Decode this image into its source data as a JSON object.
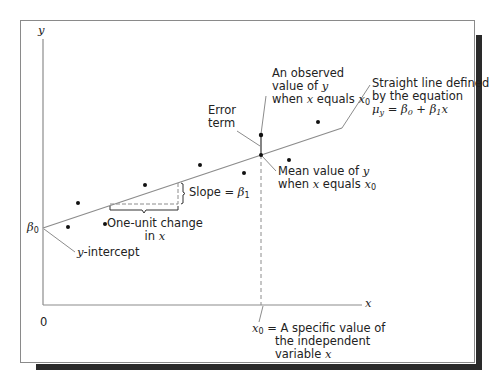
{
  "figure": {
    "axes": {
      "y_label": "y",
      "x_label": "x",
      "origin_label": "0",
      "beta0_label": "β",
      "beta0_sub": "0"
    },
    "annotations": {
      "observed": {
        "line1": "An observed",
        "line2_prefix": "value of ",
        "line2_var": "y",
        "line3_prefix": "when ",
        "line3_var": "x",
        "line3_mid": " equals ",
        "line3_sub_var": "x",
        "line3_sub": "0"
      },
      "straight_line": {
        "line1": "Straight line defined",
        "line2": "by the equation",
        "eq_mu": "μ",
        "eq_mu_sub": "y",
        "eq_rest_1": " = β",
        "eq_sub0": "0",
        "eq_rest_2": " + β",
        "eq_sub1": "1",
        "eq_x": "x"
      },
      "error_term": {
        "line1": "Error",
        "line2": "term"
      },
      "mean_value": {
        "line1_prefix": "Mean value of ",
        "line1_var": "y",
        "line2_prefix": "when ",
        "line2_var": "x",
        "line2_mid": " equals ",
        "line2_sub_var": "x",
        "line2_sub": "0"
      },
      "slope": {
        "prefix": "Slope = ",
        "beta": "β",
        "sub": "1"
      },
      "one_unit": {
        "line1": "One-unit change",
        "line2_prefix": "in ",
        "line2_var": "x"
      },
      "y_intercept": {
        "var": "y",
        "rest": "-intercept"
      },
      "x0_def": {
        "var": "x",
        "sub": "0",
        "line1_rest": " = A specific value of",
        "line2": "the independent",
        "line3_prefix": "variable ",
        "line3_var": "x"
      }
    },
    "colors": {
      "line": "#8c8c8c",
      "point": "#111111",
      "shadow": "#2a2a2a",
      "frame": "#8a8a8a"
    }
  }
}
